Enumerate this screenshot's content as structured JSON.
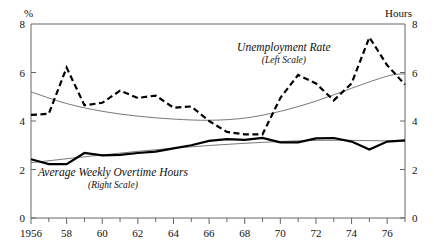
{
  "chart_data": {
    "type": "line",
    "title": "",
    "subtitle": "",
    "xlabel": "",
    "ylabel": "%",
    "y2label": "Hours",
    "xlim": [
      1956,
      1977
    ],
    "ylim": [
      0,
      8
    ],
    "y2lim": [
      0,
      8
    ],
    "grid": false,
    "legend_position": "inline-annotations",
    "x_tick_labels": [
      "1956",
      "58",
      "60",
      "62",
      "64",
      "66",
      "68",
      "70",
      "72",
      "74",
      "76"
    ],
    "x_tick_values": [
      1956,
      1958,
      1960,
      1962,
      1964,
      1966,
      1968,
      1970,
      1972,
      1974,
      1976
    ],
    "x_minor_tick_values": [
      1957,
      1959,
      1961,
      1963,
      1965,
      1967,
      1969,
      1971,
      1973,
      1975,
      1977
    ],
    "y_tick_labels": [
      "0",
      "2",
      "4",
      "6",
      "8"
    ],
    "y_tick_values": [
      0,
      2,
      4,
      6,
      8
    ],
    "y2_tick_labels": [
      "0",
      "2",
      "4",
      "6",
      "8"
    ],
    "y2_tick_values": [
      0,
      2,
      4,
      6,
      8
    ],
    "annotations": [
      {
        "name": "unemployment-annotation",
        "text": "Unemployment Rate",
        "subtext": "(Left Scale)",
        "x": 1970.2,
        "y": 6.9
      },
      {
        "name": "overtime-annotation",
        "text": "Average Weekly Overtime Hours",
        "subtext": "(Right Scale)",
        "x": 1960.6,
        "y": 1.72
      }
    ],
    "series": [
      {
        "name": "Unemployment Rate",
        "scale": "left",
        "style": "dashed",
        "width": 2.2,
        "color": "#000000",
        "x": [
          1956,
          1957,
          1958,
          1959,
          1960,
          1961,
          1962,
          1963,
          1964,
          1965,
          1966,
          1967,
          1968,
          1969,
          1970,
          1971,
          1972,
          1973,
          1974,
          1975,
          1976,
          1977
        ],
        "values": [
          4.25,
          4.3,
          6.2,
          4.65,
          4.75,
          5.25,
          4.95,
          5.05,
          4.55,
          4.6,
          4.0,
          3.55,
          3.45,
          3.45,
          4.95,
          5.9,
          5.55,
          4.85,
          5.55,
          7.45,
          6.3,
          5.5
        ]
      },
      {
        "name": "Average Weekly Overtime Hours",
        "scale": "right",
        "style": "solid",
        "width": 2.2,
        "color": "#000000",
        "x": [
          1956,
          1957,
          1958,
          1959,
          1960,
          1961,
          1962,
          1963,
          1964,
          1965,
          1966,
          1967,
          1968,
          1969,
          1970,
          1971,
          1972,
          1973,
          1974,
          1975,
          1976,
          1977
        ],
        "values": [
          2.42,
          2.22,
          2.22,
          2.68,
          2.58,
          2.6,
          2.68,
          2.74,
          2.87,
          3.0,
          3.18,
          3.25,
          3.22,
          3.3,
          3.12,
          3.12,
          3.28,
          3.3,
          3.15,
          2.82,
          3.15,
          3.2
        ]
      },
      {
        "name": "Unemployment Trend",
        "scale": "left",
        "style": "thin-curve",
        "width": 0.8,
        "color": "#555555",
        "x": [
          1956,
          1958,
          1960,
          1962,
          1964,
          1966,
          1968,
          1970,
          1972,
          1974,
          1976,
          1977
        ],
        "values": [
          5.2,
          4.72,
          4.4,
          4.2,
          4.08,
          4.03,
          4.12,
          4.4,
          4.82,
          5.35,
          5.85,
          5.95
        ]
      },
      {
        "name": "Overtime Trend",
        "scale": "right",
        "style": "thin-curve",
        "width": 0.8,
        "color": "#555555",
        "x": [
          1956,
          1960,
          1964,
          1968,
          1972,
          1976,
          1977
        ],
        "values": [
          2.28,
          2.6,
          2.88,
          3.08,
          3.2,
          3.18,
          3.16
        ]
      }
    ]
  }
}
